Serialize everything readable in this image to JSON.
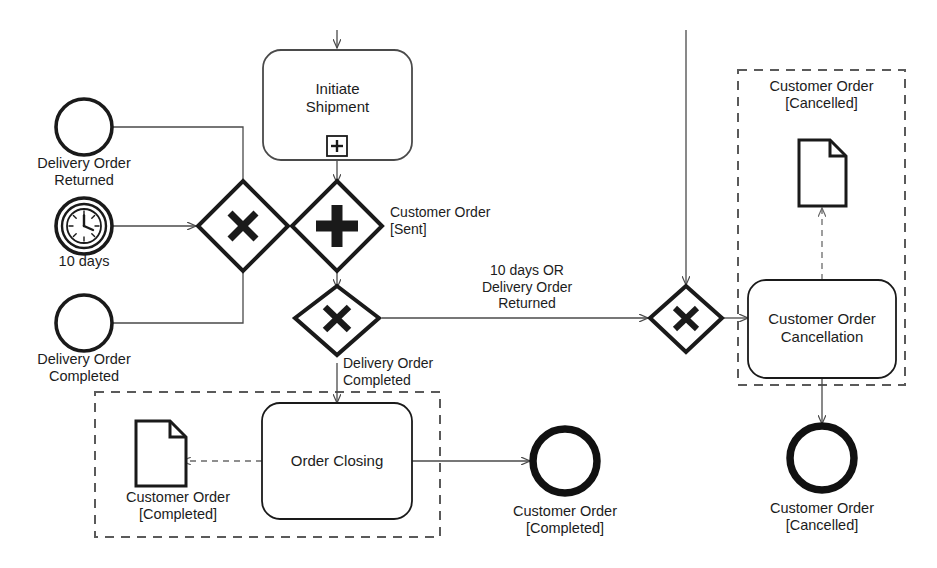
{
  "diagram": {
    "colors": {
      "stroke": "#1a1a1a",
      "flow": "#4a4a4a",
      "dashed": "#5a5a5a",
      "fill": "#ffffff"
    }
  },
  "events": {
    "start_delivery_returned": {
      "label": "Delivery Order\nReturned",
      "type": "boundary-message-event",
      "icon": "circle-icon"
    },
    "timer_10_days": {
      "label": "10 days",
      "type": "timer-event",
      "icon": "clock-icon"
    },
    "start_delivery_completed": {
      "label": "Delivery Order\nCompleted",
      "type": "boundary-event",
      "icon": "circle-icon"
    },
    "end_order_completed": {
      "label": "Customer Order\n[Completed]",
      "type": "end-event",
      "icon": "thick-circle-icon"
    },
    "end_order_cancelled": {
      "label": "Customer Order\n[Cancelled]",
      "type": "end-event",
      "icon": "thick-circle-icon"
    }
  },
  "tasks": {
    "initiate_shipment": {
      "label": "Initiate\nShipment",
      "marker": "sub-process-plus-marker"
    },
    "order_closing": {
      "label": "Order Closing",
      "marker": ""
    },
    "customer_order_cancellation": {
      "label": "Customer Order\nCancellation",
      "marker": ""
    }
  },
  "gateways": {
    "merge_exclusive": {
      "symbol": "X",
      "type": "exclusive-gateway"
    },
    "parallel_split": {
      "symbol": "+",
      "type": "parallel-gateway"
    },
    "split_exclusive": {
      "symbol": "X",
      "type": "exclusive-gateway"
    },
    "cancel_exclusive": {
      "symbol": "X",
      "type": "exclusive-gateway"
    }
  },
  "flow_labels": {
    "customer_order_sent": "Customer Order\n[Sent]",
    "ten_days_or_returned": "10 days OR\nDelivery Order\nReturned",
    "delivery_order_completed": "Delivery Order\nCompleted"
  },
  "groups": {
    "completed_group": {
      "data_object_label": "Customer Order\n[Completed]",
      "data_object_icon": "document-icon"
    },
    "cancelled_group": {
      "title": "Customer Order\n[Cancelled]",
      "data_object_icon": "document-icon"
    }
  }
}
